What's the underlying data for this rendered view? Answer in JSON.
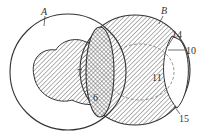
{
  "diagram": {
    "type": "venn-section-diagram",
    "colors": {
      "stroke": "#333333",
      "hatch": "#555555",
      "background": "#ffffff",
      "dashed": "#777777"
    },
    "sets": [
      {
        "id": "A",
        "label": "A"
      },
      {
        "id": "B",
        "label": "B"
      }
    ],
    "callouts": [
      {
        "id": "14",
        "label": "14"
      },
      {
        "id": "10",
        "label": "10"
      },
      {
        "id": "7",
        "label": "7"
      },
      {
        "id": "6",
        "label": "6"
      },
      {
        "id": "11",
        "label": "11"
      },
      {
        "id": "15",
        "label": "15"
      }
    ]
  }
}
